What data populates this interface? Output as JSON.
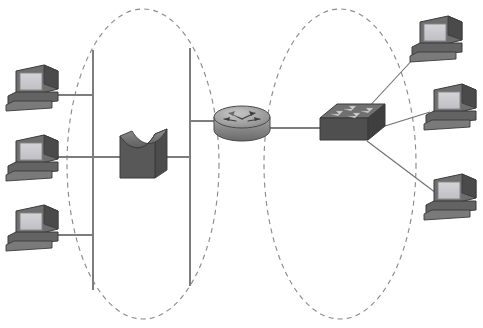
{
  "diagram": {
    "type": "network-topology",
    "width": 483,
    "height": 328,
    "background_color": "#ffffff",
    "palette": {
      "line": "#7d7d7d",
      "dashed_boundary": "#8c8c8c",
      "device_body_dark": "#4f4f4f",
      "device_body_mid": "#6b6b6b",
      "device_body_light": "#9a9a9a",
      "device_highlight": "#b4b4b4",
      "screen": "#c9c9cd",
      "screen_border": "#8d8d91",
      "outline": "#3a3a3a"
    },
    "regions": [
      {
        "id": "left-segment",
        "label": "Left network segment (bus topology)",
        "shape": "dashed-ellipse",
        "cx": 143,
        "cy": 164,
        "rx": 76,
        "ry": 155
      },
      {
        "id": "right-segment",
        "label": "Right network segment (star topology)",
        "shape": "dashed-ellipse",
        "cx": 340,
        "cy": 164,
        "rx": 76,
        "ry": 155
      }
    ],
    "nodes": [
      {
        "id": "pc-left-top",
        "label": "Workstation",
        "type": "pc",
        "x": 6,
        "y": 63,
        "w": 56,
        "h": 48
      },
      {
        "id": "pc-left-middle",
        "label": "Workstation",
        "type": "pc",
        "x": 6,
        "y": 133,
        "w": 56,
        "h": 48
      },
      {
        "id": "pc-left-bottom",
        "label": "Workstation",
        "type": "pc",
        "x": 6,
        "y": 203,
        "w": 56,
        "h": 48
      },
      {
        "id": "bridge",
        "label": "Bridge",
        "type": "bridge",
        "x": 115,
        "y": 126,
        "w": 56,
        "h": 58
      },
      {
        "id": "router",
        "label": "Router",
        "type": "router",
        "x": 212,
        "y": 100,
        "w": 60,
        "h": 45
      },
      {
        "id": "switch",
        "label": "Switch",
        "type": "switch",
        "x": 317,
        "y": 100,
        "w": 70,
        "h": 48
      },
      {
        "id": "pc-right-top",
        "label": "Workstation",
        "type": "pc",
        "x": 410,
        "y": 14,
        "w": 56,
        "h": 48
      },
      {
        "id": "pc-right-middle",
        "label": "Workstation",
        "type": "pc",
        "x": 424,
        "y": 82,
        "w": 56,
        "h": 48
      },
      {
        "id": "pc-right-bottom",
        "label": "Workstation",
        "type": "pc",
        "x": 424,
        "y": 172,
        "w": 56,
        "h": 48
      }
    ],
    "bus_lines": [
      {
        "id": "bus-left-vertical",
        "x1": 93,
        "y1": 50,
        "x2": 93,
        "y2": 290
      },
      {
        "id": "bus-right-vertical",
        "x1": 190,
        "y1": 48,
        "x2": 190,
        "y2": 286
      }
    ],
    "links": [
      {
        "id": "link-pc-left-top-bus",
        "from": "pc-left-top",
        "to": "bus-left-vertical",
        "points": "58,95 93,95"
      },
      {
        "id": "link-pc-left-middle-bus",
        "from": "pc-left-middle",
        "to": "bus-left-vertical",
        "points": "58,157 93,157"
      },
      {
        "id": "link-pc-left-bottom-bus",
        "from": "pc-left-bottom",
        "to": "bus-left-vertical",
        "points": "58,235 93,235"
      },
      {
        "id": "link-bus-left-bridge",
        "from": "bus-left-vertical",
        "to": "bridge",
        "points": "93,157 120,157"
      },
      {
        "id": "link-bridge-bus-right",
        "from": "bridge",
        "to": "bus-right-vertical",
        "points": "167,157 190,157"
      },
      {
        "id": "link-bus-right-router",
        "from": "bus-right-vertical",
        "to": "router",
        "points": "190,121 215,121"
      },
      {
        "id": "link-router-switch",
        "from": "router",
        "to": "switch",
        "points": "270,128 322,128"
      },
      {
        "id": "link-switch-pc-top",
        "from": "switch",
        "to": "pc-right-top",
        "points": "368,108 414,55"
      },
      {
        "id": "link-switch-pc-middle",
        "from": "switch",
        "to": "pc-right-middle",
        "points": "385,127 429,112"
      },
      {
        "id": "link-switch-pc-bottom",
        "from": "switch",
        "to": "pc-right-bottom",
        "points": "368,140 438,196"
      }
    ]
  }
}
